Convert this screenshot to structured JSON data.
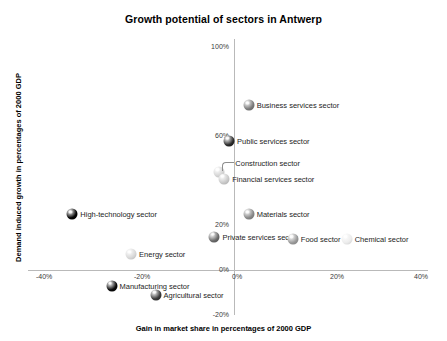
{
  "chart_data": {
    "type": "scatter",
    "title": "Growth potential of sectors in Antwerp",
    "xlabel": "Gain in market share in percentages of 2000 GDP",
    "ylabel": "Demand induced growth in percentages of 2000 GDP",
    "xlim": [
      -40,
      40
    ],
    "ylim": [
      -20,
      100
    ],
    "xticks": [
      "-40%",
      "-20%",
      "0%",
      "20%",
      "40%"
    ],
    "xtick_values": [
      -40,
      -20,
      0,
      20,
      40
    ],
    "yticks": [
      "100%",
      "60%",
      "20%",
      "0%",
      "-20%"
    ],
    "ytick_values": [
      100,
      60,
      20,
      0,
      -20
    ],
    "grid": false,
    "legend": "none",
    "points": [
      {
        "label": "Business services sector",
        "x": 3,
        "y": 74,
        "color": "#7d7d7d",
        "label_side": "right"
      },
      {
        "label": "Public services sector",
        "x": -1,
        "y": 58,
        "color": "#2e2e2e",
        "label_side": "right"
      },
      {
        "label": "Construction sector",
        "x": -3,
        "y": 44,
        "color": "#d4d4d4",
        "label_side": "leader"
      },
      {
        "label": "Financial services sector",
        "x": -2,
        "y": 41,
        "color": "#c9c9c9",
        "label_side": "right"
      },
      {
        "label": "Materials sector",
        "x": 3,
        "y": 25,
        "color": "#8a8a8a",
        "label_side": "right"
      },
      {
        "label": "Private services sector",
        "x": -4,
        "y": 15,
        "color": "#6b6b6b",
        "label_side": "right"
      },
      {
        "label": "Food sector",
        "x": 12,
        "y": 14,
        "color": "#9a9a9a",
        "label_side": "right"
      },
      {
        "label": "Chemical sector",
        "x": 23,
        "y": 14,
        "color": "#ececec",
        "label_side": "right"
      },
      {
        "label": "High-technology sector",
        "x": -33,
        "y": 25,
        "color": "#050505",
        "label_side": "right"
      },
      {
        "label": "Energy sector",
        "x": -21,
        "y": 7,
        "color": "#d8d8d8",
        "label_side": "right"
      },
      {
        "label": "Manufacturing sector",
        "x": -25,
        "y": -7,
        "color": "#0a0a0a",
        "label_side": "right"
      },
      {
        "label": "Agricultural sector",
        "x": -16,
        "y": -11,
        "color": "#3c3c3c",
        "label_side": "right"
      }
    ]
  }
}
